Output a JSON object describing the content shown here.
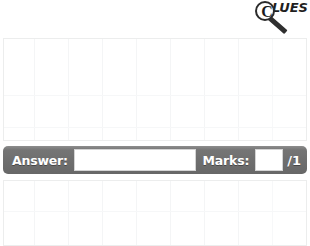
{
  "logo": {
    "lens_letter": "C",
    "word": "LUES",
    "full_name": "CLUES",
    "icon": "magnifying-glass-icon"
  },
  "question_area": {
    "top_panel_label": "question-workspace",
    "bottom_panel_label": "next-question-workspace",
    "grid": {
      "vertical_lines": 9,
      "horizontal_lines": 2
    }
  },
  "answer_bar": {
    "answer_label": "Answer:",
    "answer_value": "",
    "answer_placeholder": "",
    "marks_label": "Marks:",
    "marks_value": "",
    "marks_placeholder": "",
    "marks_total": "/1"
  },
  "colors": {
    "bar_gray": "#6e6e6e",
    "bar_highlight": "#8d8d8d",
    "field_white": "#ffffff",
    "grid_line": "#f4f5f6",
    "panel_border": "#eceded",
    "logo_ink": "#1f1f1f"
  }
}
